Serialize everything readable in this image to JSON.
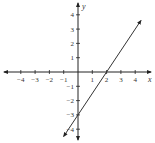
{
  "chart_data": {
    "type": "line",
    "title": "",
    "xlabel": "x",
    "ylabel": "y",
    "xlim": [
      -4.5,
      4.5
    ],
    "ylim": [
      -4.5,
      4.5
    ],
    "x_ticks": [
      -4,
      -3,
      -2,
      -1,
      1,
      2,
      3,
      4
    ],
    "y_ticks": [
      -4,
      -3,
      -2,
      -1,
      1,
      2,
      3,
      4
    ],
    "x_tick_labels": [
      "−4",
      "−3",
      "−2",
      "−1",
      "1",
      "2",
      "3",
      "4"
    ],
    "y_tick_labels": [
      "−4",
      "−3",
      "−2",
      "−1",
      "1",
      "2",
      "3",
      "4"
    ],
    "grid": false,
    "series": [
      {
        "name": "line",
        "equation": "y = 1.5x − 3",
        "slope": 1.5,
        "y_intercept": -3,
        "x_intercept": 2,
        "x": [
          -1,
          0,
          2,
          4.4
        ],
        "y": [
          -4.5,
          -3,
          0,
          3.6
        ],
        "color": "#333333",
        "arrows_both_ends": true
      }
    ]
  }
}
